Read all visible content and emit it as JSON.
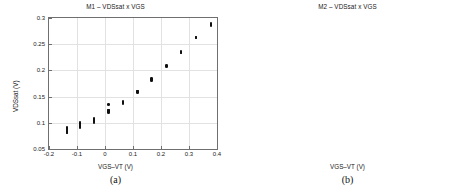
{
  "figure": {
    "panels": [
      {
        "caption": "(a)",
        "key": "a"
      },
      {
        "caption": "(b)",
        "key": "b"
      }
    ]
  },
  "chart_data": [
    {
      "type": "scatter",
      "panel": "a",
      "title": "M1 – VDSsat x VGS",
      "xlabel": "VGS–VT (V)",
      "ylabel": "VDSsat (V)",
      "xlim": [
        -0.2,
        0.4
      ],
      "ylim": [
        0.05,
        0.3
      ],
      "xticks": [
        -0.2,
        -0.1,
        0,
        0.1,
        0.2,
        0.3,
        0.4
      ],
      "xticklabels": [
        "-0.2",
        "-0.1",
        "0",
        "0.1",
        "0.2",
        "0.3",
        "0.4"
      ],
      "yticks": [
        0.05,
        0.1,
        0.15,
        0.2,
        0.25,
        0.3
      ],
      "yticklabels": [
        "0.05",
        "0.1",
        "0.15",
        "0.2",
        "0.25",
        "0.3"
      ],
      "grid": true,
      "legend": null,
      "marker": "filled-circle",
      "marker_color": "#101010",
      "points": [
        [
          -0.136,
          0.0905
        ],
        [
          -0.136,
          0.0893
        ],
        [
          -0.136,
          0.0878
        ],
        [
          -0.136,
          0.0862
        ],
        [
          -0.136,
          0.0846
        ],
        [
          -0.136,
          0.0832
        ],
        [
          -0.136,
          0.0818
        ],
        [
          -0.136,
          0.0804
        ],
        [
          -0.09,
          0.101
        ],
        [
          -0.09,
          0.0996
        ],
        [
          -0.09,
          0.0982
        ],
        [
          -0.09,
          0.0967
        ],
        [
          -0.09,
          0.0951
        ],
        [
          -0.09,
          0.0936
        ],
        [
          -0.09,
          0.092
        ],
        [
          -0.09,
          0.0906
        ],
        [
          -0.04,
          0.1085
        ],
        [
          -0.04,
          0.1072
        ],
        [
          -0.04,
          0.106
        ],
        [
          -0.04,
          0.1048
        ],
        [
          -0.04,
          0.1036
        ],
        [
          -0.04,
          0.1024
        ],
        [
          -0.04,
          0.1012
        ],
        [
          -0.04,
          0.1
        ],
        [
          0.012,
          0.1352
        ],
        [
          0.012,
          0.1248
        ],
        [
          0.012,
          0.1232
        ],
        [
          0.012,
          0.1216
        ],
        [
          0.012,
          0.1204
        ],
        [
          0.012,
          0.1192
        ],
        [
          0.065,
          0.1405
        ],
        [
          0.065,
          0.1392
        ],
        [
          0.065,
          0.138
        ],
        [
          0.065,
          0.1368
        ],
        [
          0.116,
          0.161
        ],
        [
          0.116,
          0.1598
        ],
        [
          0.116,
          0.1586
        ],
        [
          0.116,
          0.1574
        ],
        [
          0.167,
          0.184
        ],
        [
          0.167,
          0.1828
        ],
        [
          0.167,
          0.1816
        ],
        [
          0.167,
          0.1804
        ],
        [
          0.22,
          0.2095
        ],
        [
          0.22,
          0.2083
        ],
        [
          0.22,
          0.2071
        ],
        [
          0.272,
          0.2358
        ],
        [
          0.272,
          0.2346
        ],
        [
          0.272,
          0.2334
        ],
        [
          0.325,
          0.264
        ],
        [
          0.325,
          0.2628
        ],
        [
          0.325,
          0.2616
        ],
        [
          0.378,
          0.289
        ],
        [
          0.378,
          0.2876
        ],
        [
          0.378,
          0.2862
        ]
      ]
    },
    {
      "type": "scatter",
      "panel": "b",
      "title": "M2 – VDSsat x VGS",
      "xlabel": "VGS–VT (V)",
      "ylabel": "VDSsat (V)",
      "xlim": [
        -0.3,
        0.3
      ],
      "ylim": [
        0.05,
        0.25
      ],
      "xticks": [
        -0.2,
        -0.1,
        0,
        0.1,
        0.2,
        0.3
      ],
      "xticklabels": [
        "-0.2",
        "-0.1",
        "0",
        "0.1",
        "0.2",
        "0.3"
      ],
      "yticks": [
        0.05,
        0.1,
        0.15,
        0.2,
        0.25
      ],
      "yticklabels": [
        "0.05",
        "0.1",
        "0.15",
        "0.2",
        "0.25"
      ],
      "grid": true,
      "legend": null,
      "marker": "filled-circle",
      "marker_color": "#101010",
      "points": [
        [
          -0.25,
          0.0705
        ],
        [
          -0.25,
          0.0668
        ],
        [
          -0.25,
          0.0645
        ],
        [
          -0.25,
          0.0628
        ],
        [
          -0.25,
          0.0612
        ],
        [
          -0.25,
          0.0598
        ],
        [
          -0.25,
          0.0584
        ],
        [
          -0.25,
          0.057
        ],
        [
          -0.2,
          0.0835
        ],
        [
          -0.2,
          0.0812
        ],
        [
          -0.2,
          0.0795
        ],
        [
          -0.2,
          0.078
        ],
        [
          -0.2,
          0.0766
        ],
        [
          -0.2,
          0.0752
        ],
        [
          -0.2,
          0.0738
        ],
        [
          -0.2,
          0.0724
        ],
        [
          -0.15,
          0.094
        ],
        [
          -0.15,
          0.092
        ],
        [
          -0.15,
          0.0902
        ],
        [
          -0.15,
          0.0886
        ],
        [
          -0.15,
          0.087
        ],
        [
          -0.15,
          0.0854
        ],
        [
          -0.15,
          0.084
        ],
        [
          -0.15,
          0.0826
        ],
        [
          -0.1,
          0.0995
        ],
        [
          -0.1,
          0.0978
        ],
        [
          -0.1,
          0.0962
        ],
        [
          -0.1,
          0.0946
        ],
        [
          -0.1,
          0.093
        ],
        [
          -0.1,
          0.0915
        ],
        [
          -0.1,
          0.09
        ],
        [
          -0.1,
          0.0886
        ],
        [
          -0.05,
          0.1085
        ],
        [
          -0.05,
          0.1068
        ],
        [
          -0.05,
          0.1052
        ],
        [
          -0.05,
          0.1038
        ],
        [
          -0.05,
          0.1024
        ],
        [
          -0.05,
          0.101
        ],
        [
          -0.05,
          0.0996
        ],
        [
          0.0,
          0.1218
        ],
        [
          0.0,
          0.1202
        ],
        [
          0.0,
          0.1188
        ],
        [
          0.0,
          0.1174
        ],
        [
          0.0,
          0.116
        ],
        [
          0.0,
          0.1146
        ],
        [
          0.053,
          0.1368
        ],
        [
          0.053,
          0.1354
        ],
        [
          0.053,
          0.134
        ],
        [
          0.105,
          0.158
        ],
        [
          0.105,
          0.1566
        ],
        [
          0.105,
          0.1552
        ],
        [
          0.105,
          0.1538
        ],
        [
          0.157,
          0.18
        ],
        [
          0.157,
          0.1786
        ],
        [
          0.157,
          0.1772
        ],
        [
          0.21,
          0.206
        ],
        [
          0.21,
          0.2046
        ],
        [
          0.21,
          0.2032
        ],
        [
          0.262,
          0.232
        ],
        [
          0.262,
          0.2306
        ],
        [
          0.262,
          0.2292
        ]
      ]
    }
  ]
}
